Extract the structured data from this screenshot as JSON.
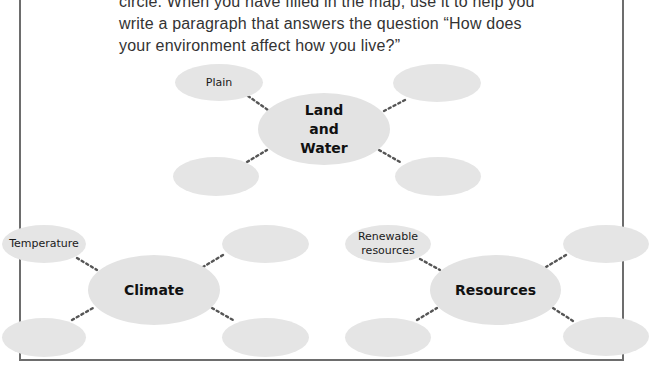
{
  "instructions": {
    "lines": [
      "circle. When you have filled in the map, use it to help you",
      "write a paragraph that answers the question “How does",
      "your environment affect how you live?”"
    ]
  },
  "maps": {
    "land_water": {
      "center_lines": [
        "Land",
        "and",
        "Water"
      ],
      "leaves": [
        "Plain",
        "",
        "",
        ""
      ]
    },
    "climate": {
      "center": "Climate",
      "leaves": [
        "Temperature",
        "",
        "",
        ""
      ]
    },
    "resources": {
      "center": "Resources",
      "leaves": [
        "Renewable",
        "resources",
        "",
        "",
        ""
      ],
      "leaf_top_left_lines": [
        "Renewable",
        "resources"
      ]
    }
  },
  "colors": {
    "ellipse_fill": "#e5e5e5",
    "frame": "#6d6d6d",
    "text": "#333333",
    "connector": "#555555"
  }
}
